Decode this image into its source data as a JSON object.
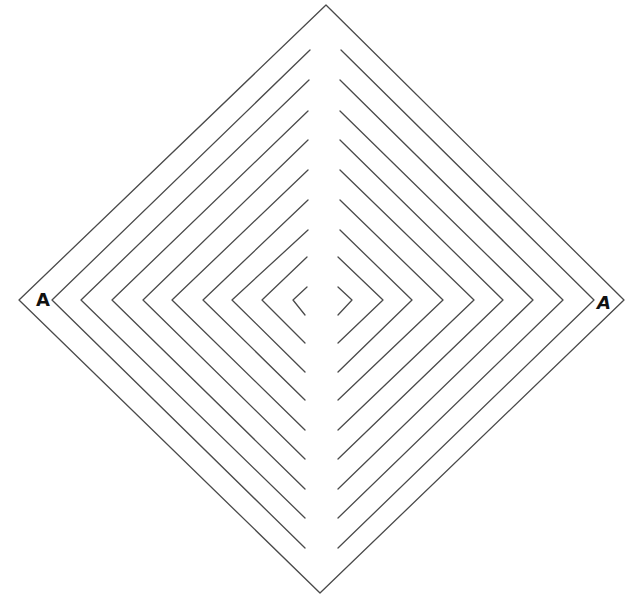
{
  "diagram": {
    "type": "concentric-diamond-maze",
    "labels": {
      "left": "A",
      "right": "A"
    },
    "colors": {
      "background": "#ffffff",
      "line": "#4a4a4a",
      "label": "#111111"
    },
    "outer_diamond": {
      "left": [
        19,
        300
      ],
      "top": [
        326,
        5
      ],
      "right": [
        624,
        300
      ],
      "bottom": [
        320,
        593
      ]
    },
    "left_chevrons": [
      {
        "vertex": [
          52,
          300
        ],
        "top_end": [
          310,
          50
        ],
        "bottom_end": [
          305,
          548
        ]
      },
      {
        "vertex": [
          81,
          300
        ],
        "top_end": [
          309,
          80
        ],
        "bottom_end": [
          305,
          518
        ]
      },
      {
        "vertex": [
          112,
          300
        ],
        "top_end": [
          308,
          111
        ],
        "bottom_end": [
          305,
          489
        ]
      },
      {
        "vertex": [
          143,
          300
        ],
        "top_end": [
          308,
          140
        ],
        "bottom_end": [
          305,
          459
        ]
      },
      {
        "vertex": [
          172,
          300
        ],
        "top_end": [
          308,
          170
        ],
        "bottom_end": [
          305,
          430
        ]
      },
      {
        "vertex": [
          203,
          300
        ],
        "top_end": [
          308,
          200
        ],
        "bottom_end": [
          305,
          400
        ]
      },
      {
        "vertex": [
          232,
          300
        ],
        "top_end": [
          308,
          230
        ],
        "bottom_end": [
          305,
          372
        ]
      },
      {
        "vertex": [
          262,
          300
        ],
        "top_end": [
          307,
          257
        ],
        "bottom_end": [
          305,
          343
        ]
      },
      {
        "vertex": [
          293,
          300
        ],
        "top_end": [
          307,
          287
        ],
        "bottom_end": [
          305,
          315
        ]
      }
    ],
    "right_chevrons": [
      {
        "vertex": [
          594,
          300
        ],
        "top_end": [
          341,
          50
        ],
        "bottom_end": [
          338,
          548
        ]
      },
      {
        "vertex": [
          563,
          300
        ],
        "top_end": [
          340,
          80
        ],
        "bottom_end": [
          338,
          518
        ]
      },
      {
        "vertex": [
          533,
          300
        ],
        "top_end": [
          340,
          111
        ],
        "bottom_end": [
          338,
          489
        ]
      },
      {
        "vertex": [
          503,
          300
        ],
        "top_end": [
          340,
          140
        ],
        "bottom_end": [
          338,
          459
        ]
      },
      {
        "vertex": [
          474,
          300
        ],
        "top_end": [
          340,
          170
        ],
        "bottom_end": [
          338,
          430
        ]
      },
      {
        "vertex": [
          443,
          300
        ],
        "top_end": [
          340,
          200
        ],
        "bottom_end": [
          338,
          400
        ]
      },
      {
        "vertex": [
          412,
          300
        ],
        "top_end": [
          340,
          230
        ],
        "bottom_end": [
          338,
          372
        ]
      },
      {
        "vertex": [
          383,
          300
        ],
        "top_end": [
          338,
          257
        ],
        "bottom_end": [
          338,
          343
        ]
      },
      {
        "vertex": [
          352,
          300
        ],
        "top_end": [
          338,
          287
        ],
        "bottom_end": [
          338,
          315
        ]
      }
    ]
  }
}
